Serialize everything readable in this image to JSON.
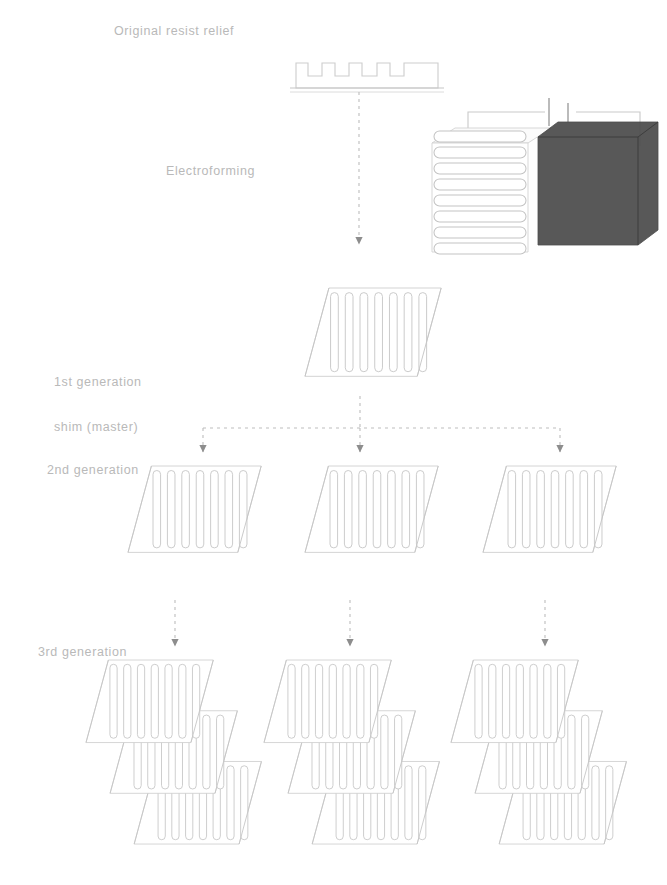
{
  "figure": {
    "background_color": "#ffffff",
    "line_color": "#c2c2c2",
    "text_color": "#b9b9b9",
    "arrow_color": "#8d8d8d",
    "cathode_color": "#4a4a4a",
    "width": 667,
    "height": 885
  },
  "labels": {
    "original_resist_relief": "Original resist relief",
    "electroforming": "Electroforming",
    "generation_1_line_1": "1st generation",
    "generation_1_line_2": "shim (master)",
    "generation_2": "2nd generation",
    "generation_3": "3rd generation"
  },
  "stages": [
    {
      "id": "original-resist-relief",
      "label": "Original resist relief",
      "graphic": "castellated-resist-profile",
      "teeth": 4,
      "substrate": "baseplate-line"
    },
    {
      "id": "electroforming",
      "label": "Electroforming",
      "graphic": "electroforming-cell",
      "components": {
        "anode_plate": "grooved-master-plate",
        "cathode_plate": "dark-solid-plate",
        "power_source": "battery-symbol",
        "wiring": "two-lead-circuit"
      }
    },
    {
      "id": "generation-1",
      "label": "1st generation shim (master)",
      "graphic": "grooved-shim",
      "count": 1,
      "grooves": 6
    },
    {
      "id": "generation-2",
      "label": "2nd generation",
      "graphic": "grooved-shim",
      "count": 3,
      "grooves": 7
    },
    {
      "id": "generation-3",
      "label": "3rd generation",
      "graphic": "stacked-grooved-shims",
      "count": 3,
      "shims_per_stack": 3,
      "grooves": 7
    }
  ],
  "connectors": [
    {
      "id": "resist-to-electroforming",
      "type": "vertical-arrow",
      "from": "original-resist-relief",
      "to": "generation-1"
    },
    {
      "id": "gen1-to-gen2-bus",
      "type": "branching-bus",
      "from": "generation-1",
      "to": "generation-2",
      "branches": 3
    },
    {
      "id": "gen2-to-gen3",
      "type": "parallel-arrows",
      "from": "generation-2",
      "to": "generation-3",
      "branches": 3
    }
  ]
}
